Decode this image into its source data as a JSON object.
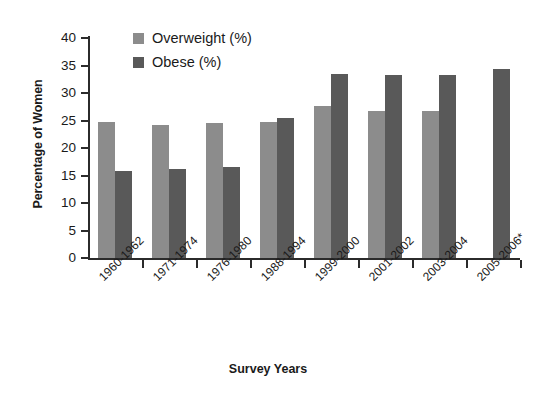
{
  "chart_data": {
    "type": "bar",
    "title": "",
    "xlabel": "Survey Years",
    "ylabel": "Percentage of Women",
    "categories": [
      "1960-1962",
      "1971-1974",
      "1976-1980",
      "1988-1994",
      "1999-2000",
      "2001-2002",
      "2003-2004",
      "2005-2006*"
    ],
    "series": [
      {
        "name": "Overweight (%)",
        "color": "#8c8c8c",
        "values": [
          24.7,
          24.2,
          24.6,
          24.7,
          27.7,
          26.8,
          26.8,
          null
        ]
      },
      {
        "name": "Obese (%)",
        "color": "#595959",
        "values": [
          15.8,
          16.2,
          16.6,
          25.5,
          33.4,
          33.3,
          33.2,
          34.4
        ]
      }
    ],
    "ylim": [
      0,
      40
    ],
    "yticks": [
      0,
      5,
      10,
      15,
      20,
      25,
      30,
      35,
      40
    ],
    "ytick_labels": [
      "0",
      "5",
      "10",
      "15",
      "20",
      "25",
      "30",
      "35",
      "40"
    ],
    "grid": false,
    "legend_position": "top-left-inside"
  },
  "axes": {
    "y_title": "Percentage of Women",
    "x_title": "Survey Years"
  },
  "legend": {
    "items": [
      {
        "label": "Overweight (%)",
        "color": "#8c8c8c"
      },
      {
        "label": "Obese (%)",
        "color": "#595959"
      }
    ]
  }
}
